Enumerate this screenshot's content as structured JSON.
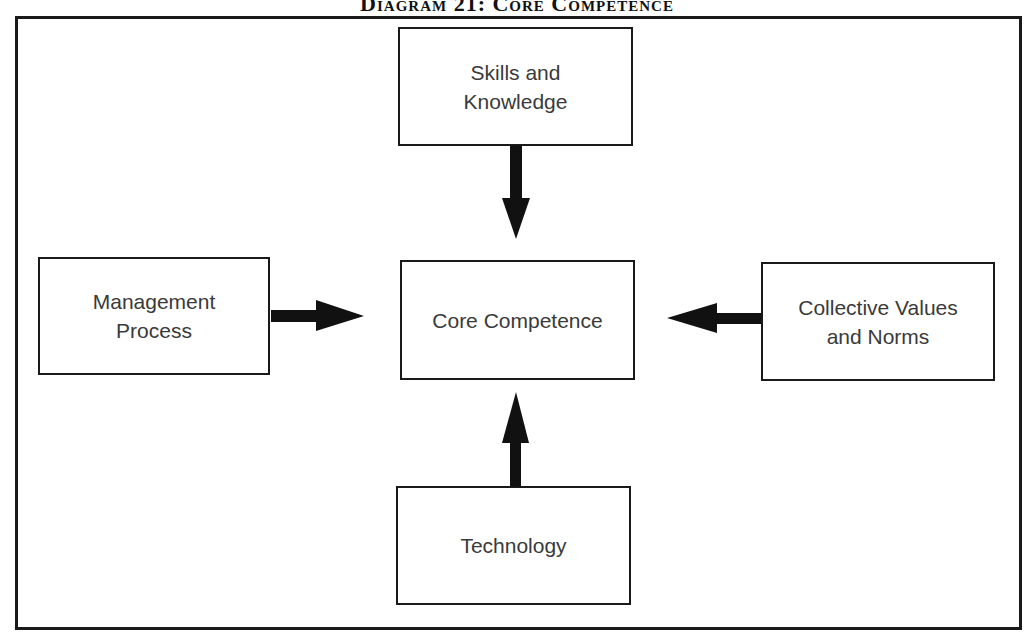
{
  "title": "Diagram 21: Core Competence",
  "nodes": {
    "skills": {
      "label": "Skills and\nKnowledge"
    },
    "management": {
      "label": "Management\nProcess"
    },
    "core": {
      "label": "Core Competence"
    },
    "collective": {
      "label": "Collective Values\nand Norms"
    },
    "technology": {
      "label": "Technology"
    }
  },
  "edges": [
    {
      "from": "Skills and Knowledge",
      "to": "Core Competence",
      "direction": "down"
    },
    {
      "from": "Management Process",
      "to": "Core Competence",
      "direction": "right"
    },
    {
      "from": "Collective Values and Norms",
      "to": "Core Competence",
      "direction": "left"
    },
    {
      "from": "Technology",
      "to": "Core Competence",
      "direction": "up"
    }
  ],
  "colors": {
    "stroke": "#1a1a1a",
    "text": "#3a3a3a",
    "background": "#ffffff"
  }
}
